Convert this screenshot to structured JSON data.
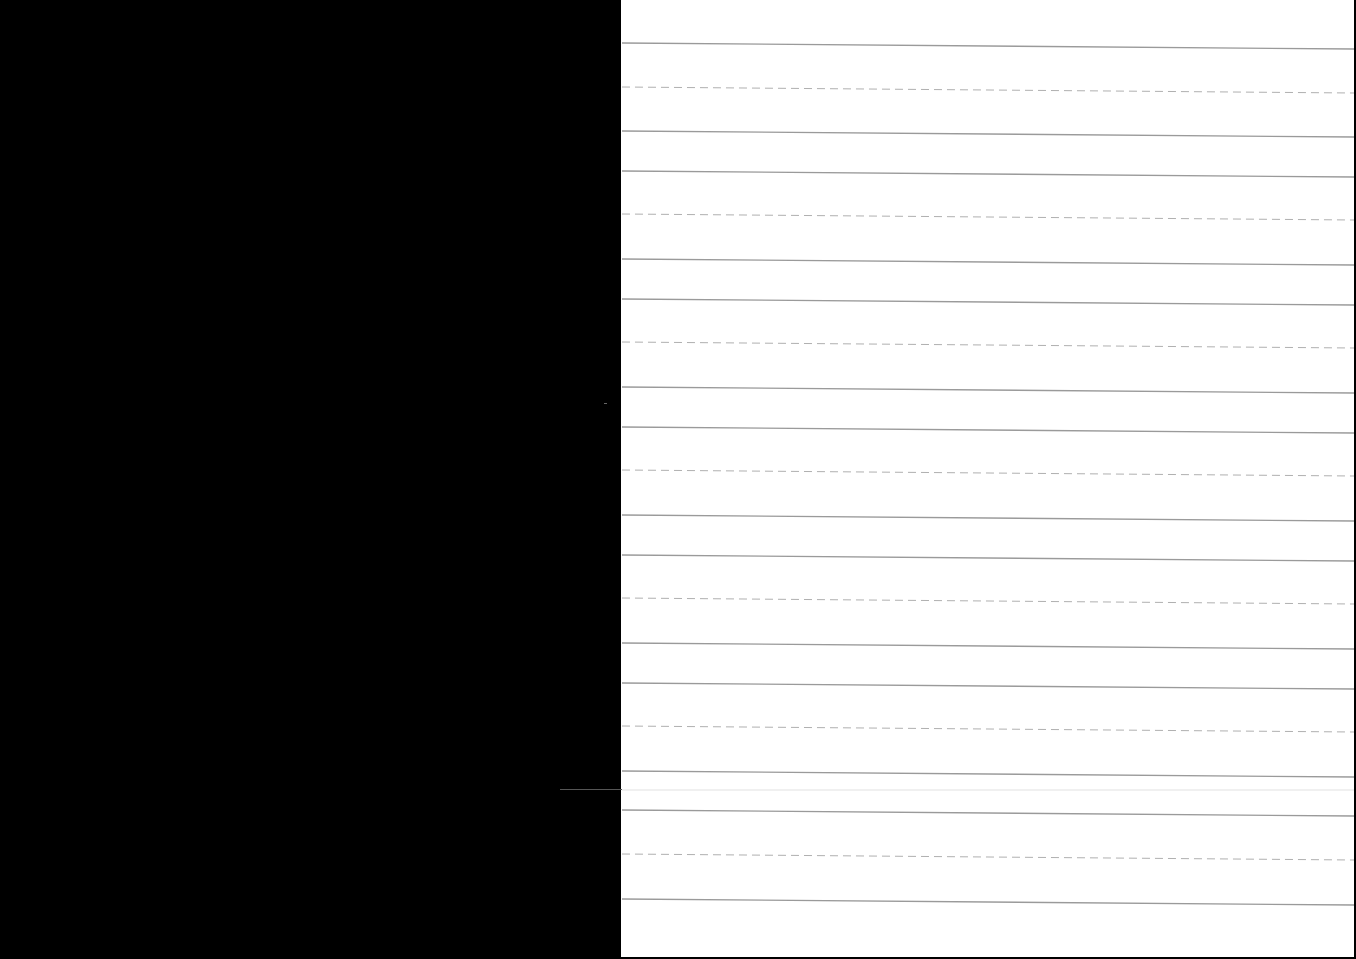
{
  "document": {
    "type": "handwriting practice sheet",
    "background_color": "#000000",
    "paper_color": "#ffffff",
    "solid_line_color": "#9a9a9a",
    "dashed_line_color": "#b0b0b0",
    "page_bounds": {
      "left": 621,
      "right": 1354,
      "top": 0,
      "bottom": 957
    },
    "skew_px_right_edge": 6,
    "writing_units": [
      {
        "top": 43,
        "midline": 87,
        "baseline": 131
      },
      {
        "top": 171,
        "midline": 214,
        "baseline": 259
      },
      {
        "top": 299,
        "midline": 342,
        "baseline": 387
      },
      {
        "top": 427,
        "midline": 470,
        "baseline": 515
      },
      {
        "top": 555,
        "midline": 598,
        "baseline": 643
      },
      {
        "top": 683,
        "midline": 726,
        "baseline": 771
      },
      {
        "top": 810,
        "midline": 854,
        "baseline": 899
      }
    ]
  }
}
